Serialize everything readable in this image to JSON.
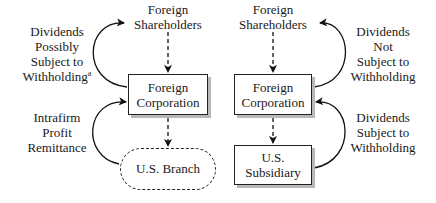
{
  "diagram": {
    "left": {
      "top_node": {
        "line1": "Foreign",
        "line2": "Shareholders"
      },
      "corp_box": {
        "line1": "Foreign",
        "line2": "Corporation"
      },
      "bottom_node": {
        "label": "U.S. Branch"
      },
      "upper_label": {
        "line1": "Dividends",
        "line2": "Possibly",
        "line3": "Subject to",
        "line4": "Withholding",
        "footnote": "a"
      },
      "lower_label": {
        "line1": "Intrafirm",
        "line2": "Profit",
        "line3": "Remittance"
      }
    },
    "right": {
      "top_node": {
        "line1": "Foreign",
        "line2": "Shareholders"
      },
      "corp_box": {
        "line1": "Foreign",
        "line2": "Corporation"
      },
      "bottom_node": {
        "line1": "U.S.",
        "line2": "Subsidiary"
      },
      "upper_label": {
        "line1": "Dividends",
        "line2": "Not",
        "line3": "Subject to",
        "line4": "Withholding"
      },
      "lower_label": {
        "line1": "Dividends",
        "line2": "Subject to",
        "line3": "Withholding"
      }
    }
  }
}
